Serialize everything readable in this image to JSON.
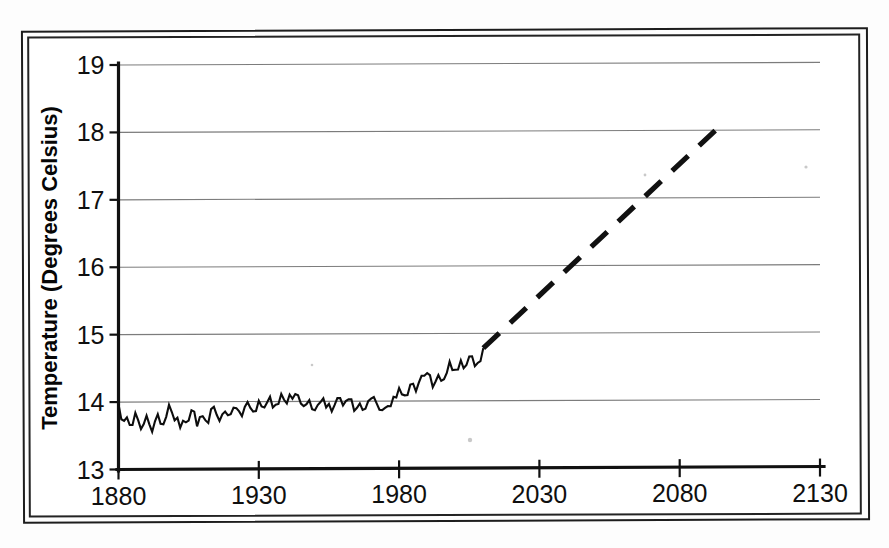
{
  "figure": {
    "background_color": "#ffffff",
    "frame_color": "#1d1d1d",
    "line_color": "#0d0d0d",
    "grid_color": "#7c7c7c"
  },
  "chart_data": {
    "type": "line",
    "title": "",
    "xlabel": "",
    "ylabel": "Temperature (Degrees Celsius)",
    "xlim": [
      1880,
      2130
    ],
    "ylim": [
      13,
      19
    ],
    "xticks": [
      1880,
      1930,
      1980,
      2030,
      2080,
      2130
    ],
    "xticklabels": [
      "1880",
      "1930",
      "1980",
      "2030",
      "2080",
      "2130"
    ],
    "yticks": [
      13,
      14,
      15,
      16,
      17,
      18,
      19
    ],
    "yticklabels": [
      "13",
      "14",
      "15",
      "16",
      "17",
      "18",
      "19"
    ],
    "grid": "horizontal",
    "legend": "none",
    "series": [
      {
        "name": "Observed global mean temperature",
        "style": "solid",
        "x": [
          1880,
          1882,
          1884,
          1886,
          1888,
          1890,
          1892,
          1894,
          1896,
          1898,
          1900,
          1902,
          1904,
          1906,
          1908,
          1910,
          1912,
          1914,
          1916,
          1918,
          1920,
          1922,
          1924,
          1926,
          1928,
          1930,
          1932,
          1934,
          1936,
          1938,
          1940,
          1942,
          1944,
          1946,
          1948,
          1950,
          1952,
          1954,
          1956,
          1958,
          1960,
          1962,
          1964,
          1966,
          1968,
          1970,
          1972,
          1974,
          1976,
          1978,
          1980,
          1982,
          1984,
          1986,
          1988,
          1990,
          1992,
          1994,
          1996,
          1998,
          2000,
          2002,
          2004,
          2006,
          2008,
          2010
        ],
        "values": [
          13.97,
          13.72,
          13.66,
          13.84,
          13.6,
          13.8,
          13.56,
          13.82,
          13.67,
          13.96,
          13.73,
          13.62,
          13.7,
          13.88,
          13.64,
          13.79,
          13.69,
          13.93,
          13.72,
          13.86,
          13.82,
          13.91,
          13.79,
          14.0,
          13.86,
          14.02,
          13.92,
          14.08,
          13.96,
          14.12,
          13.98,
          14.05,
          14.1,
          13.94,
          14.03,
          13.88,
          14.0,
          13.92,
          13.86,
          14.06,
          13.95,
          14.04,
          13.87,
          13.98,
          13.9,
          14.05,
          13.98,
          13.88,
          13.94,
          14.08,
          14.21,
          14.1,
          14.26,
          14.16,
          14.39,
          14.43,
          14.22,
          14.4,
          14.34,
          14.6,
          14.48,
          14.62,
          14.55,
          14.68,
          14.58,
          14.8
        ]
      },
      {
        "name": "Projected temperature",
        "style": "dashed",
        "x": [
          2010,
          2095
        ],
        "values": [
          14.8,
          18.12
        ]
      }
    ],
    "annotations": []
  }
}
